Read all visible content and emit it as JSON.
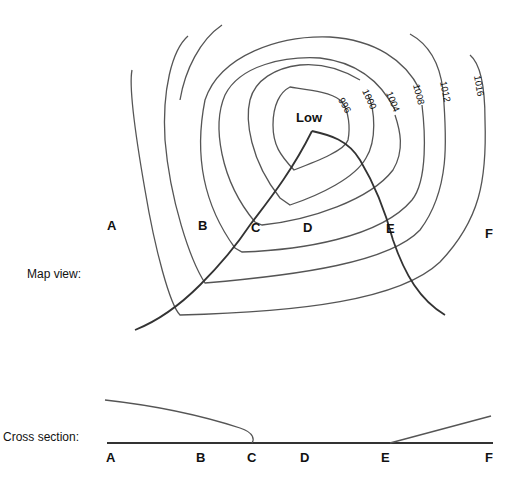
{
  "map_view": {
    "label": "Map view:",
    "center_label": "Low",
    "points": [
      "A",
      "B",
      "C",
      "D",
      "E",
      "F"
    ],
    "isobars": [
      "996",
      "1000",
      "1004",
      "1008",
      "1012",
      "1016"
    ]
  },
  "cross_section": {
    "label": "Cross section:",
    "points": [
      "A",
      "B",
      "C",
      "D",
      "E",
      "F"
    ]
  },
  "colors": {
    "line": "#555555",
    "front": "#333333",
    "text": "#111111"
  }
}
